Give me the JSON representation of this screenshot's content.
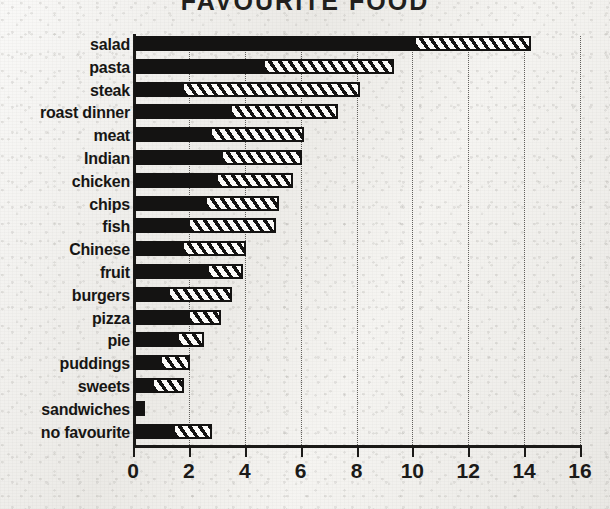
{
  "title": "FAVOURITE FOOD",
  "axis": {
    "x_ticks": [
      0,
      2,
      4,
      6,
      8,
      10,
      12,
      14,
      16
    ],
    "x_min": 0,
    "x_max": 16
  },
  "chart_data": {
    "type": "bar",
    "orientation": "horizontal",
    "stacked": true,
    "title": "FAVOURITE FOOD",
    "xlabel": "",
    "ylabel": "",
    "xlim": [
      0,
      16
    ],
    "grid": "vertical-dotted",
    "legend": "none",
    "categories": [
      "salad",
      "pasta",
      "steak",
      "roast dinner",
      "meat",
      "Indian",
      "chicken",
      "chips",
      "fish",
      "Chinese",
      "fruit",
      "burgers",
      "pizza",
      "pie",
      "puddings",
      "sweets",
      "sandwiches",
      "no favourite"
    ],
    "series": [
      {
        "name": "solid",
        "fill": "solid-black",
        "values": [
          10.1,
          4.7,
          1.8,
          3.5,
          2.8,
          3.2,
          3.0,
          2.6,
          2.0,
          1.8,
          2.7,
          1.3,
          2.0,
          1.6,
          1.0,
          0.7,
          0.4,
          1.45
        ]
      },
      {
        "name": "hatched",
        "fill": "diagonal-hatch",
        "values": [
          4.1,
          4.6,
          6.3,
          3.8,
          3.3,
          2.8,
          2.7,
          2.6,
          3.1,
          2.2,
          1.2,
          2.2,
          1.1,
          0.9,
          1.0,
          1.1,
          0.0,
          1.35
        ]
      }
    ],
    "totals": [
      14.2,
      9.3,
      8.1,
      7.3,
      6.1,
      6.0,
      5.7,
      5.2,
      5.1,
      4.0,
      3.9,
      3.5,
      3.1,
      2.5,
      2.0,
      1.8,
      0.4,
      2.8
    ]
  },
  "colors": {
    "ink": "#141312",
    "paper": "#f3f2ef",
    "gridline": "#4a4845"
  }
}
